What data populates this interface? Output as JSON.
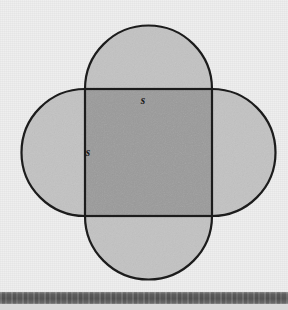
{
  "canvas": {
    "width": 288,
    "height": 310,
    "background_color": "#eeeeee"
  },
  "figure": {
    "name": "quatrefoil",
    "square": {
      "x": 85,
      "y": 89,
      "width": 127,
      "height": 127,
      "fill_color": "#9a9a9a",
      "stroke_color": "#1c1c1c",
      "stroke_width": 2.2
    },
    "lobes": {
      "radius": 63.5,
      "count": 4,
      "fill_color": "#c2c2c2",
      "stroke_color": "#1c1c1c",
      "stroke_width": 2.2,
      "positions": [
        "top",
        "right",
        "bottom",
        "left"
      ]
    },
    "labels": [
      {
        "text": "s",
        "x": 143,
        "y": 104,
        "side": "top",
        "style": "italic"
      },
      {
        "text": "s",
        "x": 88,
        "y": 156,
        "side": "left",
        "style": "italic"
      }
    ]
  },
  "bottom_band": {
    "y": 292,
    "height": 12,
    "color": "#5d5d5d"
  },
  "bottom_strip": {
    "y": 304,
    "height": 6,
    "color": "#d9d9d9"
  }
}
